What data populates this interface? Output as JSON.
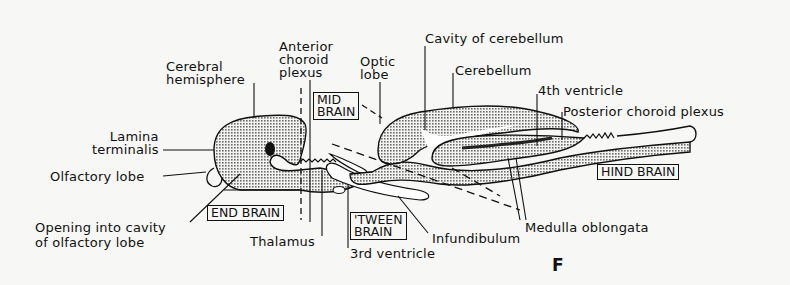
{
  "figure": {
    "letter": "F",
    "regions": [
      {
        "id": "end_brain",
        "label": "END BRAIN"
      },
      {
        "id": "tween_brain",
        "label": "'TWEEN\nBRAIN"
      },
      {
        "id": "mid_brain",
        "label": "MID\nBRAIN"
      },
      {
        "id": "hind_brain",
        "label": "HIND BRAIN"
      }
    ],
    "labels": {
      "cerebral_hemisphere": "Cerebral\nhemisphere",
      "anterior_choroid_plexus": "Anterior\nchoroid\nplexus",
      "optic_lobe": "Optic\nlobe",
      "cavity_of_cerebellum": "Cavity of cerebellum",
      "cerebellum": "Cerebellum",
      "fourth_ventricle": "4th ventricle",
      "posterior_choroid_plexus": "Posterior choroid plexus",
      "lamina_terminalis": "Lamina\nterminalis",
      "olfactory_lobe": "Olfactory lobe",
      "opening_into_cavity": "Opening into cavity\nof olfactory lobe",
      "thalamus": "Thalamus",
      "third_ventricle": "3rd ventricle",
      "infundibulum": "Infundibulum",
      "medulla_oblongata": "Medulla oblongata"
    },
    "colors": {
      "ink": "#111111",
      "stipple": "#8a8a8a",
      "paper": "#f7f7f5"
    }
  }
}
